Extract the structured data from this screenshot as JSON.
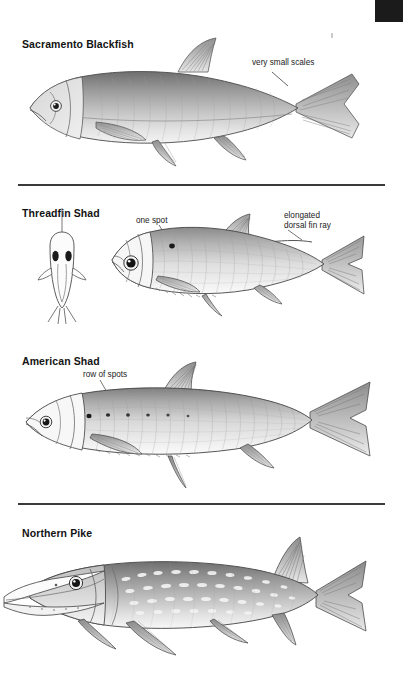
{
  "page": {
    "background_color": "#ffffff",
    "ink_color": "#000000",
    "edge_tab_color": "#1b1b1b",
    "rule_color": "#3a3a3a"
  },
  "edge_tab": {
    "name": "page-edge-tab",
    "label": ""
  },
  "dividers": [
    {
      "id": "divider-1",
      "y": 184
    },
    {
      "id": "divider-2",
      "y": 503
    }
  ],
  "species": [
    {
      "id": "sacramento-blackfish",
      "title": "Sacramento Blackfish",
      "title_x": 22,
      "title_y": 38,
      "callouts": [
        {
          "id": "very-small-scales",
          "text": "very small scales",
          "x": 252,
          "y": 58
        }
      ],
      "illustration": "lateral-view-fish-sacramento-blackfish",
      "has_dorsal_view": false
    },
    {
      "id": "threadfin-shad",
      "title": "Threadfin Shad",
      "title_x": 22,
      "title_y": 207,
      "callouts": [
        {
          "id": "one-spot",
          "text": "one spot",
          "x": 136,
          "y": 216
        },
        {
          "id": "elongated-dorsal-fin-ray-line1",
          "text": "elongated",
          "x": 284,
          "y": 211
        },
        {
          "id": "elongated-dorsal-fin-ray-line2",
          "text": "dorsal fin ray",
          "x": 284,
          "y": 221
        }
      ],
      "illustration": "lateral-view-fish-threadfin-shad",
      "has_dorsal_view": true,
      "dorsal_view_label": "dorsal-view-threadfin-shad"
    },
    {
      "id": "american-shad",
      "title": "American Shad",
      "title_x": 22,
      "title_y": 355,
      "callouts": [
        {
          "id": "row-of-spots",
          "text": "row of spots",
          "x": 83,
          "y": 370
        }
      ],
      "illustration": "lateral-view-fish-american-shad",
      "has_dorsal_view": false
    },
    {
      "id": "northern-pike",
      "title": "Northern Pike",
      "title_x": 22,
      "title_y": 527,
      "callouts": [],
      "illustration": "lateral-view-fish-northern-pike",
      "has_dorsal_view": false
    }
  ]
}
